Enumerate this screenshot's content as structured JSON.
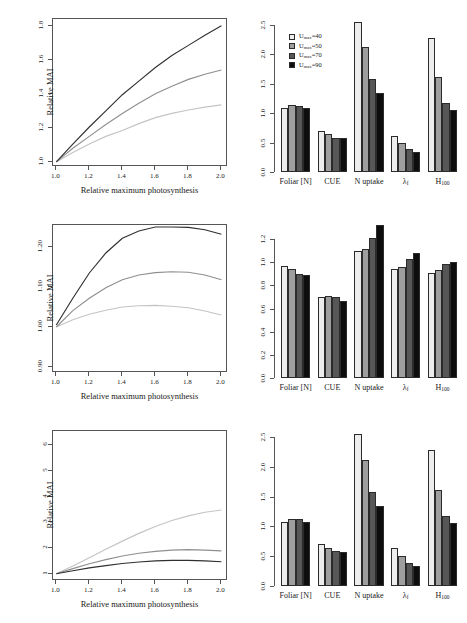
{
  "figure": {
    "panel_count": 6,
    "rows": 3
  },
  "series_legend": {
    "title": "",
    "items": [
      {
        "label": "Umax=40",
        "symbol": "U",
        "sub": "max",
        "value": "=40",
        "color": "#ededed"
      },
      {
        "label": "Umax=50",
        "symbol": "U",
        "sub": "max",
        "value": "=50",
        "color": "#9e9e9e"
      },
      {
        "label": "Umax=70",
        "symbol": "U",
        "sub": "max",
        "value": "=70",
        "color": "#575757"
      },
      {
        "label": "Umax=90",
        "symbol": "U",
        "sub": "max",
        "value": "=90",
        "color": "#0d0d0d"
      }
    ]
  },
  "line_colors": [
    "#bdbdbd",
    "#8a8a8a",
    "#333333"
  ],
  "chart_data": [
    {
      "id": "line-top",
      "type": "line",
      "title": "",
      "xlabel": "Relative maximum photosynthesis",
      "ylabel": "Relative MAI",
      "xlim": [
        0.98,
        2.04
      ],
      "ylim": [
        0.97,
        1.84
      ],
      "xticks": [
        "1.0",
        "1.2",
        "1.4",
        "1.6",
        "1.8",
        "2.0"
      ],
      "xtickvals": [
        1.0,
        1.2,
        1.4,
        1.6,
        1.8,
        2.0
      ],
      "yticks": [
        "1.0",
        "1.2",
        "1.4",
        "1.6",
        "1.8"
      ],
      "ytickvals": [
        1.0,
        1.2,
        1.4,
        1.6,
        1.8
      ],
      "grid": false,
      "legend_position": "none",
      "x": [
        1.0,
        1.1,
        1.2,
        1.3,
        1.4,
        1.5,
        1.6,
        1.7,
        1.8,
        1.9,
        2.0
      ],
      "series": [
        {
          "name": "low",
          "color": "#c4c4c4",
          "values": [
            1.0,
            1.055,
            1.105,
            1.15,
            1.185,
            1.225,
            1.26,
            1.285,
            1.305,
            1.322,
            1.335
          ]
        },
        {
          "name": "medium",
          "color": "#8f8f8f",
          "values": [
            1.0,
            1.08,
            1.15,
            1.22,
            1.285,
            1.345,
            1.4,
            1.445,
            1.485,
            1.515,
            1.54
          ]
        },
        {
          "name": "high",
          "color": "#303030",
          "values": [
            1.0,
            1.105,
            1.205,
            1.3,
            1.395,
            1.475,
            1.555,
            1.625,
            1.685,
            1.745,
            1.8
          ]
        }
      ]
    },
    {
      "id": "bar-top",
      "type": "bar",
      "title": "",
      "xlabel": "",
      "ylabel": "",
      "ylim": [
        0,
        2.62
      ],
      "yticks": [
        "0.0",
        "0.5",
        "1.0",
        "1.5",
        "2.0",
        "2.5"
      ],
      "ytickvals": [
        0.0,
        0.5,
        1.0,
        1.5,
        2.0,
        2.5
      ],
      "categories": [
        "Foliar [N]",
        "CUE",
        "N uptake",
        "λ",
        "H"
      ],
      "category_subs": [
        "",
        "",
        "",
        "f",
        "100"
      ],
      "grid": false,
      "legend_position": "top-left",
      "series": [
        {
          "name": "Umax=40",
          "color": "#ededed",
          "values": [
            1.09,
            0.7,
            2.55,
            0.62,
            2.28
          ]
        },
        {
          "name": "Umax=50",
          "color": "#9e9e9e",
          "values": [
            1.14,
            0.65,
            2.12,
            0.5,
            1.61
          ]
        },
        {
          "name": "Umax=70",
          "color": "#575757",
          "values": [
            1.13,
            0.58,
            1.58,
            0.39,
            1.18
          ]
        },
        {
          "name": "Umax=90",
          "color": "#0d0d0d",
          "values": [
            1.09,
            0.57,
            1.35,
            0.34,
            1.06
          ]
        }
      ]
    },
    {
      "id": "line-middle",
      "type": "line",
      "title": "",
      "xlabel": "Relative maximum photosynthesis",
      "ylabel": "Relative MAI",
      "xlim": [
        0.98,
        2.04
      ],
      "ylim": [
        0.885,
        1.255
      ],
      "xticks": [
        "1.0",
        "1.2",
        "1.4",
        "1.6",
        "1.8",
        "2.0"
      ],
      "xtickvals": [
        1.0,
        1.2,
        1.4,
        1.6,
        1.8,
        2.0
      ],
      "yticks": [
        "0.90",
        "1.00",
        "1.10",
        "1.20"
      ],
      "ytickvals": [
        0.9,
        1.0,
        1.1,
        1.2
      ],
      "grid": false,
      "legend_position": "none",
      "x": [
        1.0,
        1.1,
        1.2,
        1.3,
        1.4,
        1.5,
        1.6,
        1.7,
        1.8,
        1.9,
        2.0
      ],
      "series": [
        {
          "name": "low",
          "color": "#c4c4c4",
          "values": [
            1.0,
            1.018,
            1.032,
            1.042,
            1.05,
            1.053,
            1.054,
            1.052,
            1.048,
            1.04,
            1.03
          ]
        },
        {
          "name": "medium",
          "color": "#8f8f8f",
          "values": [
            1.0,
            1.041,
            1.072,
            1.098,
            1.118,
            1.13,
            1.136,
            1.138,
            1.137,
            1.13,
            1.118
          ]
        },
        {
          "name": "high",
          "color": "#303030",
          "values": [
            1.005,
            1.072,
            1.135,
            1.185,
            1.222,
            1.24,
            1.25,
            1.25,
            1.249,
            1.243,
            1.232
          ]
        }
      ]
    },
    {
      "id": "bar-middle",
      "type": "bar",
      "title": "",
      "xlabel": "",
      "ylabel": "",
      "ylim": [
        0,
        1.33
      ],
      "yticks": [
        "0.0",
        "0.2",
        "0.4",
        "0.6",
        "0.8",
        "1.0",
        "1.2"
      ],
      "ytickvals": [
        0.0,
        0.2,
        0.4,
        0.6,
        0.8,
        1.0,
        1.2
      ],
      "categories": [
        "Foliar [N]",
        "CUE",
        "N uptake",
        "λ",
        "H"
      ],
      "category_subs": [
        "",
        "",
        "",
        "f",
        "100"
      ],
      "grid": false,
      "legend_position": "none",
      "series": [
        {
          "name": "Umax=40",
          "color": "#ededed",
          "values": [
            0.965,
            0.7,
            1.095,
            0.945,
            0.905
          ]
        },
        {
          "name": "Umax=50",
          "color": "#9e9e9e",
          "values": [
            0.94,
            0.71,
            1.115,
            0.955,
            0.93
          ]
        },
        {
          "name": "Umax=70",
          "color": "#575757",
          "values": [
            0.895,
            0.7,
            1.21,
            1.03,
            0.985
          ]
        },
        {
          "name": "Umax=90",
          "color": "#0d0d0d",
          "values": [
            0.89,
            0.665,
            1.32,
            1.08,
            1.0
          ]
        }
      ]
    },
    {
      "id": "line-bottom",
      "type": "line",
      "title": "",
      "xlabel": "Relative maximum photosynthesis",
      "ylabel": "Relative MAI",
      "xlim": [
        0.98,
        2.04
      ],
      "ylim": [
        0.72,
        6.55
      ],
      "xticks": [
        "1.0",
        "1.2",
        "1.4",
        "1.6",
        "1.8",
        "2.0"
      ],
      "xtickvals": [
        1.0,
        1.2,
        1.4,
        1.6,
        1.8,
        2.0
      ],
      "yticks": [
        "1",
        "2",
        "3",
        "4",
        "5",
        "6"
      ],
      "ytickvals": [
        1,
        2,
        3,
        4,
        5,
        6
      ],
      "grid": false,
      "legend_position": "none",
      "x": [
        1.0,
        1.1,
        1.2,
        1.3,
        1.4,
        1.5,
        1.6,
        1.7,
        1.8,
        1.9,
        2.0
      ],
      "series": [
        {
          "name": "low",
          "color": "#c4c4c4",
          "values": [
            1.0,
            1.3,
            1.62,
            1.95,
            2.27,
            2.57,
            2.84,
            3.07,
            3.25,
            3.39,
            3.48
          ]
        },
        {
          "name": "medium",
          "color": "#8f8f8f",
          "values": [
            1.0,
            1.2,
            1.39,
            1.55,
            1.69,
            1.8,
            1.87,
            1.92,
            1.94,
            1.92,
            1.89
          ]
        },
        {
          "name": "high",
          "color": "#303030",
          "values": [
            1.0,
            1.12,
            1.23,
            1.32,
            1.4,
            1.46,
            1.5,
            1.52,
            1.52,
            1.5,
            1.47
          ]
        }
      ]
    },
    {
      "id": "bar-bottom",
      "type": "bar",
      "title": "",
      "xlabel": "",
      "ylabel": "",
      "ylim": [
        0,
        2.62
      ],
      "yticks": [
        "0.0",
        "0.5",
        "1.0",
        "1.5",
        "2.0",
        "2.5"
      ],
      "ytickvals": [
        0.0,
        0.5,
        1.0,
        1.5,
        2.0,
        2.5
      ],
      "categories": [
        "Foliar [N]",
        "CUE",
        "N uptake",
        "λ",
        "H"
      ],
      "category_subs": [
        "",
        "",
        "",
        "f",
        "100"
      ],
      "grid": false,
      "legend_position": "none",
      "series": [
        {
          "name": "Umax=40",
          "color": "#ededed",
          "values": [
            1.08,
            0.7,
            2.55,
            0.63,
            2.29
          ]
        },
        {
          "name": "Umax=50",
          "color": "#9e9e9e",
          "values": [
            1.13,
            0.64,
            2.12,
            0.51,
            1.61
          ]
        },
        {
          "name": "Umax=70",
          "color": "#575757",
          "values": [
            1.12,
            0.58,
            1.58,
            0.39,
            1.18
          ]
        },
        {
          "name": "Umax=90",
          "color": "#0d0d0d",
          "values": [
            1.08,
            0.57,
            1.35,
            0.34,
            1.06
          ]
        }
      ]
    }
  ]
}
